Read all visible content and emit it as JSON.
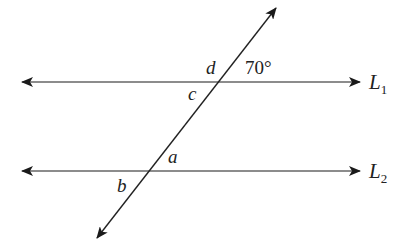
{
  "diagram": {
    "type": "parallel-lines-transversal",
    "lines": [
      {
        "name": "L1",
        "label_main": "L",
        "label_sub": "1"
      },
      {
        "name": "L2",
        "label_main": "L",
        "label_sub": "2"
      }
    ],
    "angles": {
      "given": "70°",
      "a": "a",
      "b": "b",
      "c": "c",
      "d": "d"
    },
    "colors": {
      "line": "#555555",
      "transversal": "#222222",
      "text": "#222222"
    }
  }
}
